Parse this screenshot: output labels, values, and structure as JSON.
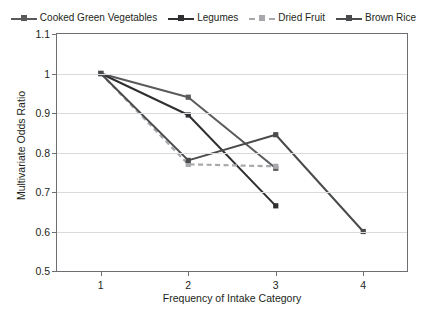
{
  "chart_data": {
    "type": "line",
    "title": "",
    "xlabel": "Frequency of Intake Category",
    "ylabel": "Multivariate Odds Ratio",
    "x": [
      1,
      2,
      3,
      4
    ],
    "categories": [
      "1",
      "2",
      "3",
      "4"
    ],
    "xtick_labels": [
      "1",
      "2",
      "3",
      "4"
    ],
    "ytick_labels": [
      "1.1",
      "1",
      "0.9",
      "0.8",
      "0.7",
      "0.6",
      "0.5"
    ],
    "ytick_values": [
      1.1,
      1.0,
      0.9,
      0.8,
      0.7,
      0.6,
      0.5
    ],
    "ylim": [
      0.5,
      1.1
    ],
    "xlim": [
      0.5,
      4.5
    ],
    "grid": "horizontal",
    "legend_position": "top",
    "marker": "square",
    "series": [
      {
        "name": "Cooked Green Vegetables",
        "color": "#595a5c",
        "dash": "solid",
        "x": [
          1,
          2,
          3
        ],
        "values": [
          1.0,
          0.94,
          0.76
        ]
      },
      {
        "name": "Legumes",
        "color": "#2f2f31",
        "dash": "solid",
        "x": [
          1,
          2,
          3
        ],
        "values": [
          1.0,
          0.895,
          0.665
        ]
      },
      {
        "name": "Dried Fruit",
        "color": "#a6a8ab",
        "dash": "dashed",
        "x": [
          1,
          2,
          3
        ],
        "values": [
          1.0,
          0.77,
          0.765
        ]
      },
      {
        "name": "Brown Rice",
        "color": "#4a4b4d",
        "dash": "solid",
        "x": [
          1,
          2,
          3,
          4
        ],
        "values": [
          1.0,
          0.78,
          0.845,
          0.6
        ]
      }
    ]
  },
  "legend": {
    "items": [
      {
        "label": "Cooked Green Vegetables"
      },
      {
        "label": "Legumes"
      },
      {
        "label": "Dried Fruit"
      },
      {
        "label": "Brown Rice"
      }
    ]
  },
  "axes": {
    "y_title": "Multivariate Odds Ratio",
    "x_title": "Frequency of Intake Category"
  },
  "colors": {
    "axis": "#6d6e71",
    "grid": "#d9dadb",
    "text": "#231f20",
    "background": "#ffffff"
  }
}
